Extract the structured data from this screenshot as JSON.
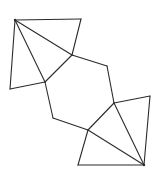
{
  "diagram": {
    "title": "",
    "stroke_color": "#2b2b2b",
    "background": "#ffffff",
    "vertices": {
      "A": [
        15,
        20
      ],
      "B": [
        81,
        19
      ],
      "C": [
        72,
        55
      ],
      "D": [
        45,
        82
      ],
      "E": [
        10,
        89
      ],
      "F": [
        107,
        66
      ],
      "G": [
        114,
        103
      ],
      "H": [
        150,
        96
      ],
      "I": [
        144,
        165
      ],
      "J": [
        88,
        130
      ],
      "K": [
        53,
        118
      ],
      "L": [
        78,
        165
      ]
    },
    "edges": [
      [
        "A",
        "B"
      ],
      [
        "B",
        "C"
      ],
      [
        "A",
        "C"
      ],
      [
        "A",
        "D"
      ],
      [
        "C",
        "D"
      ],
      [
        "A",
        "E"
      ],
      [
        "E",
        "D"
      ],
      [
        "C",
        "F"
      ],
      [
        "F",
        "G"
      ],
      [
        "D",
        "K"
      ],
      [
        "K",
        "J"
      ],
      [
        "J",
        "G"
      ],
      [
        "G",
        "H"
      ],
      [
        "H",
        "I"
      ],
      [
        "G",
        "I"
      ],
      [
        "J",
        "I"
      ],
      [
        "J",
        "L"
      ],
      [
        "L",
        "I"
      ]
    ],
    "marked_vertices": [
      "A",
      "I"
    ]
  }
}
